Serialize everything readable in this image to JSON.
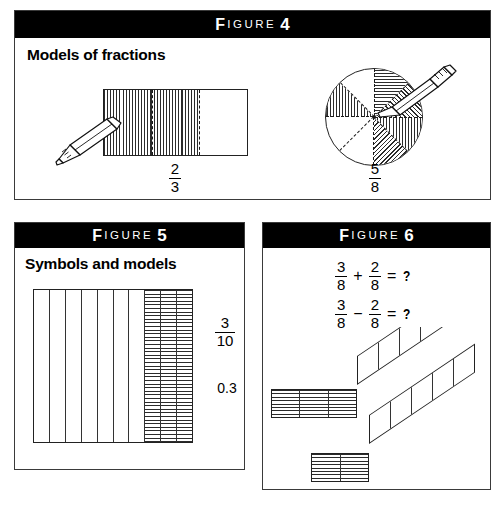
{
  "figures": [
    {
      "id": "figure4",
      "label_word": "IGURE",
      "label_initial": "F",
      "number": "4",
      "heading": "Models of fractions",
      "models": [
        {
          "name": "rectangle-thirds",
          "shape": "rectangle",
          "parts_total": 3,
          "parts_shaded": 2,
          "numerator": "2",
          "denominator": "3"
        },
        {
          "name": "circle-eighths",
          "shape": "circle",
          "parts_total": 8,
          "parts_shaded": 5,
          "numerator": "5",
          "denominator": "8"
        }
      ]
    },
    {
      "id": "figure5",
      "label_word": "IGURE",
      "label_initial": "F",
      "number": "5",
      "heading": "Symbols and models",
      "grid": {
        "columns_total": 10,
        "columns_shaded": 3
      },
      "fraction": {
        "numerator": "3",
        "denominator": "10"
      },
      "decimal": "0.3"
    },
    {
      "id": "figure6",
      "label_word": "IGURE",
      "label_initial": "F",
      "number": "6",
      "equations": [
        {
          "name": "addition",
          "left_num": "3",
          "left_den": "8",
          "operator": "+",
          "right_num": "2",
          "right_den": "8",
          "equals": "=",
          "result": "?"
        },
        {
          "name": "subtraction",
          "left_num": "3",
          "left_den": "8",
          "operator": "−",
          "right_num": "2",
          "right_den": "8",
          "equals": "=",
          "result": "?"
        }
      ],
      "strips": [
        {
          "name": "upper-strip",
          "front_cells": 3,
          "front_hatched": 3,
          "band_cells": 5
        },
        {
          "name": "lower-strip",
          "front_cells": 2,
          "front_hatched": 2,
          "band_cells": 5
        }
      ]
    }
  ],
  "colors": {
    "ink": "#000000",
    "panel_border": "#3a3a3a",
    "titlebar_bg": "#000000",
    "titlebar_text": "#ffffff",
    "page_bg": "#ffffff"
  }
}
